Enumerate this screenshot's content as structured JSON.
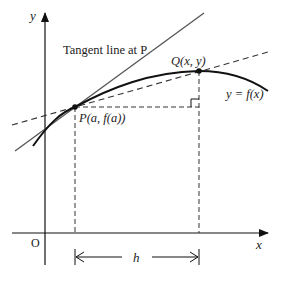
{
  "diagram": {
    "axes": {
      "x_label": "x",
      "y_label": "y",
      "origin_label": "O"
    },
    "labels": {
      "tangent": "Tangent line at P",
      "point_p": "P(a, f(a))",
      "point_q": "Q(x, y)",
      "curve": "y = f(x)",
      "increment": "h"
    },
    "colors": {
      "line": "#222222",
      "tangent": "#555555",
      "dashed": "#333333",
      "background": "#ffffff"
    }
  }
}
